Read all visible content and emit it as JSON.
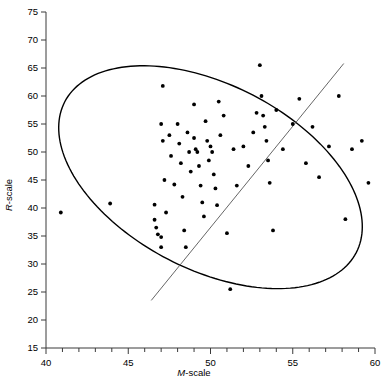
{
  "chart_data": {
    "type": "scatter",
    "title": "",
    "xlabel": "M-scale",
    "ylabel": "R-scale",
    "xlabel_italic_prefix": "M",
    "xlabel_rest": "-scale",
    "ylabel_italic_prefix": "R",
    "ylabel_rest": "-scale",
    "xlim": [
      40,
      60
    ],
    "ylim": [
      15,
      75
    ],
    "x_major_ticks": [
      40,
      45,
      50,
      55,
      60
    ],
    "x_minor_tick_step": 1,
    "y_major_ticks": [
      15,
      20,
      25,
      30,
      35,
      40,
      45,
      50,
      55,
      60,
      65,
      70,
      75
    ],
    "grid": false,
    "legend": "none",
    "point_color": "#000000",
    "line_color": "#555555",
    "ellipse_color": "#000000",
    "x": [
      40.9,
      43.9,
      46.6,
      46.6,
      46.7,
      46.8,
      47.0,
      47.0,
      47.0,
      47.1,
      47.1,
      47.2,
      47.3,
      47.5,
      47.6,
      47.8,
      48.0,
      48.1,
      48.2,
      48.3,
      48.4,
      48.5,
      48.6,
      48.7,
      48.8,
      49.0,
      49.0,
      49.1,
      49.2,
      49.3,
      49.4,
      49.5,
      49.6,
      49.7,
      49.8,
      49.9,
      50.0,
      50.1,
      50.2,
      50.3,
      50.4,
      50.5,
      50.6,
      50.8,
      51.0,
      51.2,
      51.4,
      51.6,
      52.0,
      52.3,
      52.6,
      52.8,
      53.0,
      53.1,
      53.2,
      53.3,
      53.4,
      53.5,
      53.6,
      53.8,
      54.0,
      54.4,
      55.0,
      55.4,
      55.8,
      56.2,
      56.6,
      57.2,
      57.8,
      58.2,
      58.6,
      59.2,
      59.6
    ],
    "y": [
      39.2,
      40.8,
      40.6,
      37.9,
      36.5,
      35.3,
      34.8,
      33.0,
      55.0,
      52.0,
      61.8,
      45.0,
      39.2,
      53.0,
      49.3,
      44.2,
      55.0,
      51.5,
      48.0,
      42.0,
      36.0,
      33.0,
      53.5,
      50.0,
      46.5,
      58.5,
      52.5,
      50.5,
      50.0,
      47.5,
      44.0,
      41.0,
      38.5,
      55.5,
      52.0,
      48.5,
      51.0,
      50.0,
      46.0,
      43.5,
      40.5,
      59.0,
      53.0,
      56.5,
      35.5,
      25.5,
      50.5,
      44.0,
      51.0,
      47.5,
      53.5,
      57.0,
      65.5,
      60.0,
      56.5,
      54.5,
      52.0,
      48.5,
      44.5,
      36.0,
      57.5,
      50.5,
      55.0,
      59.5,
      48.0,
      54.5,
      45.5,
      51.0,
      60.0,
      38.0,
      50.5,
      52.0,
      44.5
    ],
    "regression_line": {
      "x1": 46.4,
      "y1": 23.5,
      "x2": 58.1,
      "y2": 65.8
    },
    "ellipse": {
      "center_x": 50.0,
      "center_y": 45.5,
      "semi_major": 17.6,
      "semi_minor": 10.4,
      "rotation_deg": -32.0
    }
  }
}
